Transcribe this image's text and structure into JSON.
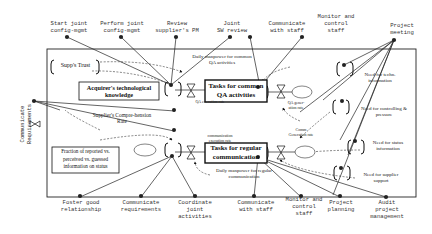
{
  "diagram": {
    "outer_boundary": {
      "x": 47,
      "y": 49,
      "w": 369,
      "h": 148
    },
    "stocks": {
      "acquirer_knowledge": "Acquirer's technological knowledge",
      "fraction_reported": "Fraction of reported vs. perceived vs. guessed information on status",
      "tasks_qa": "Tasks for common QA activities",
      "tasks_comm": "Tasks for regular communication",
      "supps_trust": "Supp's Trust"
    },
    "rates": {
      "qa_execution": "QA execution rate",
      "comm_execution": "communication execution rate",
      "qa_generation": "QA gener-ation rate",
      "comm_generation": "Comm Generation rate",
      "supplier_comprehension": "Supplier's Compre-hension Rate"
    },
    "auxiliaries": {
      "daily_manpower_qa": "Daily manpower for common QA activities",
      "daily_manpower_comm": "Daily manpower for regular communication",
      "need_techn_info": "Need for techn. information",
      "need_controlling": "Need for controlling & pressure",
      "need_status_info": "Need for status information",
      "need_supplier_support": "Need for supplier support"
    },
    "external_activities_top": [
      {
        "label": "Start joint\nconfig-mgmt"
      },
      {
        "label": "Perform joint\nconfig-mgmt"
      },
      {
        "label": "Review\nsupplier's PM"
      },
      {
        "label": "Joint\nSW review"
      },
      {
        "label": "Communicate\nwith staff"
      },
      {
        "label": "Monitor and\ncontrol\nstaff"
      },
      {
        "label": "Project\nmeeting"
      }
    ],
    "external_activities_bottom": [
      {
        "label": "Foster good\nrelationship"
      },
      {
        "label": "Communicate\nrequirements"
      },
      {
        "label": "Coordinate\njoint\nactivities"
      },
      {
        "label": "Communicate\nwith staff"
      },
      {
        "label": "Monitor and\ncontrol\nstaff"
      },
      {
        "label": "Project\nplanning"
      },
      {
        "label": "Audit\nproject\nmanagement"
      }
    ],
    "external_activities_left": [
      {
        "label": "Communicate\nRequirements"
      }
    ]
  }
}
